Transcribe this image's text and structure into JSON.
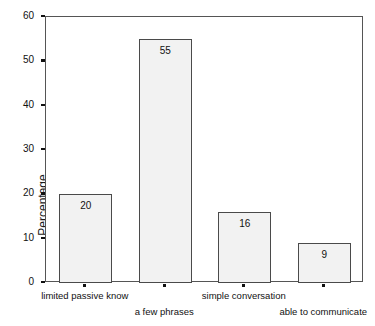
{
  "chart_data": {
    "type": "bar",
    "title": "",
    "subtitle": "",
    "xlabel": "",
    "ylabel": "Percentage",
    "categories": [
      "limited passive know",
      "a few phrases",
      "simple conversation",
      "able to communicate"
    ],
    "values": [
      20,
      55,
      16,
      9
    ],
    "data_labels": [
      "20",
      "55",
      "16",
      "9"
    ],
    "ylim": [
      0,
      60
    ],
    "yticks": [
      0,
      10,
      20,
      30,
      40,
      50,
      60
    ],
    "ytick_labels": [
      "0",
      "10",
      "20",
      "30",
      "40",
      "50",
      "60"
    ],
    "grid": false,
    "legend": false,
    "legend_position": "none",
    "bar_fill_color": "#f2f2f2",
    "bar_border_color": "#4a4a4a",
    "axis_color": "#555555",
    "text_color": "#111111",
    "label_rows": [
      0,
      1,
      0,
      1
    ]
  },
  "axis": {
    "y_title": "Percentage"
  }
}
